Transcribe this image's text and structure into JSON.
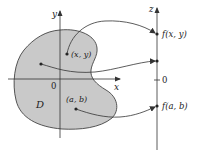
{
  "diagram": {
    "type": "function-mapping",
    "colors": {
      "region_fill": "#c9c9c9",
      "stroke": "#333333",
      "background": "#ffffff"
    },
    "domain_plane": {
      "x_axis_label": "x",
      "y_axis_label": "y",
      "origin_label": "0",
      "region_label": "D",
      "points": [
        {
          "label": "(x, y)"
        },
        {
          "label": ""
        },
        {
          "label": "(a, b)"
        }
      ]
    },
    "range_axis": {
      "axis_label": "z",
      "origin_label": "0",
      "points": [
        {
          "label": "f(x, y)"
        },
        {
          "label": ""
        },
        {
          "label": "f(a, b)"
        }
      ]
    }
  }
}
